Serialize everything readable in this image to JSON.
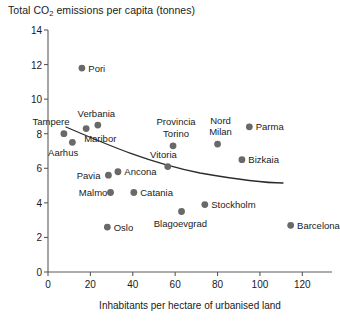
{
  "chart_data": {
    "type": "scatter",
    "title": "Total CO2 emissions per capita (tonnes)",
    "title_main": "Total CO",
    "title_sub": "2",
    "title_rest": " emissions per capita (tonnes)",
    "xlabel": "Inhabitants per hectare of urbanised land",
    "ylabel": "Total CO2 emissions per capita (tonnes)",
    "xlim": [
      0,
      134
    ],
    "ylim": [
      0,
      14
    ],
    "xticks": [
      0,
      20,
      40,
      60,
      80,
      100,
      120
    ],
    "yticks": [
      0,
      2,
      4,
      6,
      8,
      10,
      12,
      14
    ],
    "grid": false,
    "legend": "none",
    "marker_color": "#696969",
    "axis_color": "#5b5b5b",
    "trend_color": "#2b2b2b",
    "has_trend_line": true,
    "trend_note": "Downward sloping fitted curve from left to right",
    "points": [
      {
        "label": "Pori",
        "x": 16.0,
        "y": 11.8,
        "label_pos": "right"
      },
      {
        "label": "Tampere",
        "x": 7.5,
        "y": 8.0,
        "label_pos": "above-left"
      },
      {
        "label": "Maribor",
        "x": 18.0,
        "y": 8.3,
        "label_pos": "below-right"
      },
      {
        "label": "Verbania",
        "x": 23.5,
        "y": 8.5,
        "label_pos": "above"
      },
      {
        "label": "Aarhus",
        "x": 11.5,
        "y": 7.5,
        "label_pos": "below-left"
      },
      {
        "label": "Provincia Torino",
        "x": 59.0,
        "y": 7.3,
        "label_pos": "above"
      },
      {
        "label": "Nord Milan",
        "x": 80.0,
        "y": 7.4,
        "label_pos": "above"
      },
      {
        "label": "Parma",
        "x": 95.0,
        "y": 8.4,
        "label_pos": "right"
      },
      {
        "label": "Vitoria",
        "x": 56.5,
        "y": 6.1,
        "label_pos": "above"
      },
      {
        "label": "Bizkaia",
        "x": 91.5,
        "y": 6.5,
        "label_pos": "right"
      },
      {
        "label": "Pavia",
        "x": 28.5,
        "y": 5.6,
        "label_pos": "left"
      },
      {
        "label": "Ancona",
        "x": 33.0,
        "y": 5.8,
        "label_pos": "right"
      },
      {
        "label": "Malmo",
        "x": 29.5,
        "y": 4.6,
        "label_pos": "left"
      },
      {
        "label": "Catania",
        "x": 40.5,
        "y": 4.6,
        "label_pos": "right"
      },
      {
        "label": "Oslo",
        "x": 28.0,
        "y": 2.6,
        "label_pos": "right"
      },
      {
        "label": "Blagoevgrad",
        "x": 63.0,
        "y": 3.5,
        "label_pos": "below"
      },
      {
        "label": "Stockholm",
        "x": 74.0,
        "y": 3.9,
        "label_pos": "right"
      },
      {
        "label": "Barcelona",
        "x": 114.5,
        "y": 2.7,
        "label_pos": "right"
      }
    ]
  }
}
